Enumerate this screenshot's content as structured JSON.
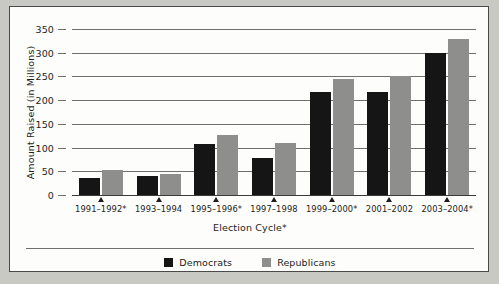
{
  "chart_data": {
    "type": "bar",
    "title": "",
    "xlabel": "Election Cycle*",
    "ylabel": "Amount Raised (in Millions)",
    "categories": [
      "1991–1992*",
      "1993–1994",
      "1995–1996*",
      "1997–1998",
      "1999–2000*",
      "2001–2002",
      "2003–2004*"
    ],
    "series": [
      {
        "name": "Democrats",
        "color": "#151515",
        "values": [
          35,
          41,
          107,
          77,
          218,
          218,
          300
        ]
      },
      {
        "name": "Republicans",
        "color": "#8e8e8c",
        "values": [
          52,
          45,
          126,
          110,
          244,
          250,
          328
        ]
      }
    ],
    "ylim": [
      0,
      350
    ],
    "ytick_values": [
      0,
      50,
      100,
      150,
      200,
      250,
      300,
      350
    ],
    "ytick_labels": [
      "0",
      "50",
      "100",
      "150",
      "200",
      "250",
      "300",
      "350"
    ],
    "grid": true,
    "legend_position": "bottom"
  },
  "legend": {
    "items": [
      {
        "label": "Democrats",
        "swatch": "dem"
      },
      {
        "label": "Republicans",
        "swatch": "rep"
      }
    ]
  }
}
